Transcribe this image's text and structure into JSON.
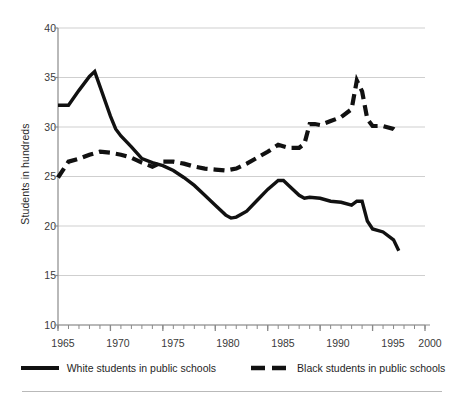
{
  "chart_data": {
    "type": "line",
    "title": "",
    "subtitle": "",
    "xlabel": "",
    "ylabel": "Students in hundreds",
    "xlim": [
      1965,
      2000
    ],
    "ylim": [
      10,
      40
    ],
    "xticks": [
      1965,
      1970,
      1975,
      1980,
      1985,
      1990,
      1995,
      2000
    ],
    "yticks": [
      10,
      15,
      20,
      25,
      30,
      35,
      40
    ],
    "minor_xticks_every": 1,
    "grid": "horizontal",
    "legend_position": "bottom",
    "series": [
      {
        "name": "White students in public schools",
        "style": "solid",
        "color": "#111111",
        "x": [
          1965,
          1966,
          1967,
          1968,
          1968.5,
          1969,
          1970,
          1970.5,
          1971,
          1972,
          1973,
          1974,
          1975,
          1976,
          1977,
          1978,
          1979,
          1980,
          1981,
          1981.5,
          1982,
          1983,
          1984,
          1985,
          1986,
          1986.5,
          1987,
          1988,
          1988.5,
          1989,
          1990,
          1991,
          1992,
          1993,
          1993.5,
          1994,
          1994.5,
          1995,
          1996,
          1997,
          1997.5
        ],
        "values": [
          32.2,
          32.2,
          33.7,
          35.1,
          35.6,
          34.1,
          31.1,
          29.8,
          29.1,
          28.0,
          26.8,
          26.4,
          26.1,
          25.6,
          24.9,
          24.1,
          23.1,
          22.1,
          21.1,
          20.8,
          20.9,
          21.5,
          22.6,
          23.7,
          24.6,
          24.6,
          24.1,
          23.1,
          22.8,
          22.9,
          22.8,
          22.5,
          22.4,
          22.1,
          22.5,
          22.5,
          20.5,
          19.7,
          19.4,
          18.6,
          17.5
        ]
      },
      {
        "name": "Black students in public schools",
        "style": "dashed",
        "color": "#111111",
        "x": [
          1965,
          1966,
          1967,
          1968,
          1969,
          1970,
          1971,
          1972,
          1973,
          1974,
          1975,
          1976,
          1977,
          1978,
          1979,
          1980,
          1981,
          1982,
          1983,
          1984,
          1985,
          1986,
          1987,
          1988,
          1988.5,
          1989,
          1989.5,
          1990,
          1991,
          1992,
          1993,
          1993.5,
          1994,
          1994.5,
          1995,
          1996,
          1997,
          1997.5
        ],
        "values": [
          24.9,
          26.5,
          26.8,
          27.2,
          27.5,
          27.4,
          27.2,
          26.9,
          26.4,
          26.0,
          26.5,
          26.5,
          26.3,
          26.0,
          25.8,
          25.7,
          25.6,
          25.8,
          26.3,
          26.9,
          27.5,
          28.2,
          27.9,
          27.9,
          28.3,
          30.3,
          30.3,
          30.2,
          30.6,
          31.0,
          31.8,
          34.7,
          33.6,
          30.8,
          30.1,
          30.1,
          29.8,
          29.4
        ]
      }
    ]
  },
  "axes": {
    "ylabel": "Students in hundreds",
    "ytick_labels": [
      "40",
      "35",
      "30",
      "25",
      "20",
      "15",
      "10"
    ],
    "xtick_labels": [
      "1965",
      "1970",
      "1975",
      "1980",
      "1985",
      "1990",
      "1995",
      "2000"
    ]
  },
  "legend": {
    "items": [
      {
        "label": "White students in public schools",
        "style": "solid"
      },
      {
        "label": "Black students in public schools",
        "style": "dashed"
      }
    ]
  },
  "colors": {
    "line": "#111111",
    "grid": "#cfcfcf",
    "axis": "#8a8a8a",
    "text": "#2b2b2b"
  }
}
